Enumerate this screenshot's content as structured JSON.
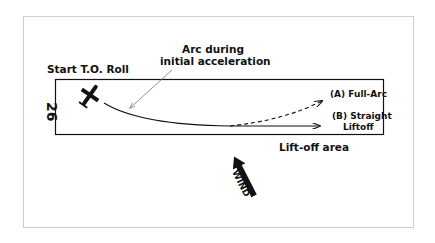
{
  "diagram": {
    "title_labels": {
      "start": "Start T.O. Roll",
      "arc_line1": "Arc during",
      "arc_line2": "initial acceleration",
      "full_arc": "(A) Full-Arc",
      "straight_line1": "(B) Straight",
      "straight_line2": "Liftoff",
      "liftoff_area": "Lift-off area",
      "wind": "WIND",
      "runway_number": "26"
    },
    "colors": {
      "ink": "#111111",
      "pointer": "#777777",
      "frame": "#cfcfcf"
    }
  }
}
